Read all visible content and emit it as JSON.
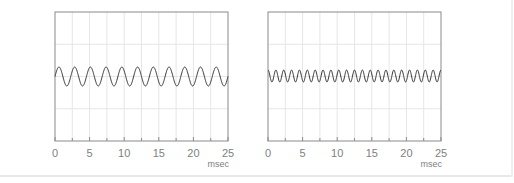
{
  "colors": {
    "axis": "#8a8a8a",
    "grid": "#e6e6e6",
    "wave": "#333333",
    "text": "#808080"
  },
  "chart_data": [
    {
      "type": "line",
      "title": "",
      "xlabel": "msec",
      "ylabel": "",
      "xlim": [
        0,
        25
      ],
      "x_ticks": [
        "0",
        "5",
        "10",
        "15",
        "20",
        "25"
      ],
      "grid": true,
      "series": [
        {
          "name": "sine wave",
          "cycles_in_window": 11,
          "frequency_hz": 440,
          "amplitude_rel": 0.15,
          "phase": "sine"
        }
      ],
      "box": {
        "left": 55,
        "top": 12,
        "right": 228,
        "bottom": 141
      },
      "wave": {
        "center_y": 76.5,
        "amp_px": 9.5,
        "cycles": 11,
        "phase_deg": 0
      }
    },
    {
      "type": "line",
      "title": "",
      "xlabel": "msec",
      "ylabel": "",
      "xlim": [
        0,
        25
      ],
      "x_ticks": [
        "0",
        "5",
        "10",
        "15",
        "20",
        "25"
      ],
      "grid": true,
      "series": [
        {
          "name": "sine wave",
          "cycles_in_window": 22,
          "frequency_hz": 880,
          "amplitude_rel": 0.1,
          "phase": "cosine"
        }
      ],
      "box": {
        "left": 268,
        "top": 12,
        "right": 441,
        "bottom": 141
      },
      "wave": {
        "center_y": 76,
        "amp_px": 6,
        "cycles": 22,
        "phase_deg": 90
      }
    }
  ]
}
